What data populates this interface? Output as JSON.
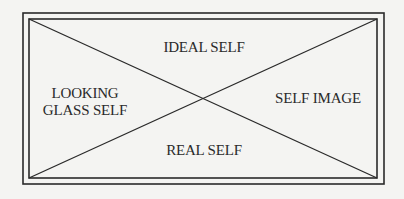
{
  "diagram": {
    "type": "self-concept-quadrant",
    "structure": "rectangle with double border divided by two diagonals into four triangular regions",
    "labels": {
      "top": "IDEAL SELF",
      "left_line1": "LOOKING",
      "left_line2": "GLASS SELF",
      "right": "SELF IMAGE",
      "bottom": "REAL SELF"
    },
    "colors": {
      "background": "#f4f4f2",
      "line": "#2a2a2a",
      "text": "#2a2a2a"
    }
  }
}
